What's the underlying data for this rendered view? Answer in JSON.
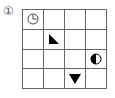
{
  "puzzle": {
    "label": "①",
    "rows": 4,
    "cols": 4,
    "cells": [
      {
        "row": 0,
        "col": 0,
        "icon": "clock-icon"
      },
      {
        "row": 1,
        "col": 1,
        "icon": "right-triangle-icon"
      },
      {
        "row": 2,
        "col": 3,
        "icon": "half-filled-circle-icon"
      },
      {
        "row": 3,
        "col": 2,
        "icon": "down-triangle-icon"
      }
    ],
    "colors": {
      "grid_line": "#666666",
      "fill": "#000000",
      "background": "#ffffff"
    }
  }
}
